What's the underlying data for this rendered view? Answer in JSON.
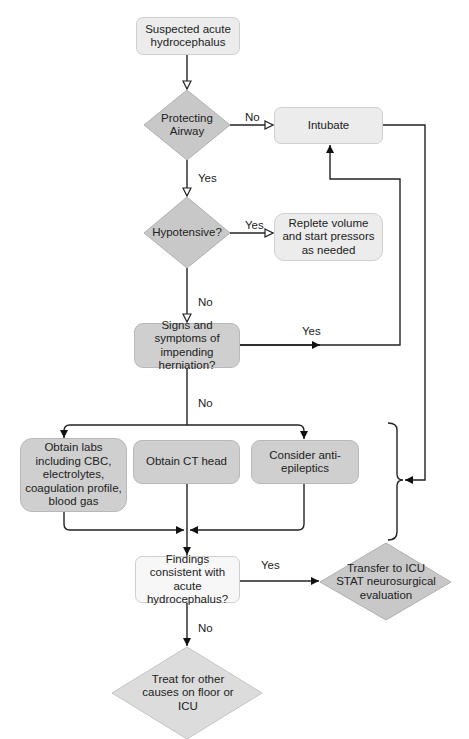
{
  "diagram": {
    "nodes": {
      "start": "Suspected acute hydrocephalus",
      "airway": "Protecting Airway",
      "intubate": "Intubate",
      "hypotensive": "Hypotensive?",
      "replete": "Replete volume and start pressors as needed",
      "herniation": "Signs and symptoms of impending herniation?",
      "labs": "Obtain labs including CBC, electrolytes, coagulation profile, blood gas",
      "ct": "Obtain CT head",
      "antiepileptics": "Consider anti-epileptics",
      "findings": "Findings consistent with acute hydrocephalus?",
      "transfer": "Transfer to ICU STAT neurosurgical evaluation",
      "treat": "Treat for other causes on floor or ICU"
    },
    "edge_labels": {
      "airway_no": "No",
      "airway_yes": "Yes",
      "hypo_yes": "Yes",
      "hypo_no": "No",
      "herniation_yes": "Yes",
      "herniation_no": "No",
      "findings_yes": "Yes",
      "findings_no": "No"
    },
    "colors": {
      "diamond_fill": "#c8c8c8",
      "box_gray": "#cfcfcf",
      "box_light": "#ececec",
      "line": "#222222"
    }
  }
}
